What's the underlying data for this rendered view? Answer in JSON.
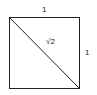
{
  "diagram": {
    "type": "unit-square-with-diagonal",
    "labels": {
      "top_side": "1",
      "right_side": "1",
      "diagonal": "√2"
    },
    "colors": {
      "stroke": "#222222",
      "background": "#ffffff"
    }
  }
}
